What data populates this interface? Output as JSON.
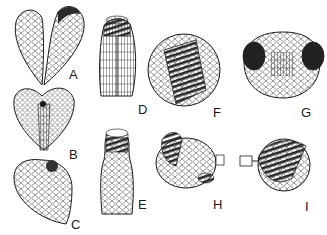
{
  "figure": {
    "panels": [
      {
        "id": "A",
        "label": "A",
        "x": 69,
        "y": 68,
        "subject": "bilobed-leaf"
      },
      {
        "id": "B",
        "label": "B",
        "x": 69,
        "y": 148,
        "subject": "heart-shaped-leaf"
      },
      {
        "id": "C",
        "label": "C",
        "x": 71,
        "y": 218,
        "subject": "ovoid-capsule"
      },
      {
        "id": "D",
        "label": "D",
        "x": 138,
        "y": 103,
        "subject": "elongate-capsule-top"
      },
      {
        "id": "E",
        "label": "E",
        "x": 138,
        "y": 198,
        "subject": "elongate-capsule-collar"
      },
      {
        "id": "F",
        "label": "F",
        "x": 213,
        "y": 106,
        "subject": "spherical-body-ribbed"
      },
      {
        "id": "G",
        "label": "G",
        "x": 301,
        "y": 106,
        "subject": "dome-with-lateral-lobes"
      },
      {
        "id": "H",
        "label": "H",
        "x": 213,
        "y": 198,
        "subject": "body-with-appendage"
      },
      {
        "id": "I",
        "label": "I",
        "x": 305,
        "y": 200,
        "subject": "ribbed-globe-with-stalk"
      }
    ],
    "colors": {
      "ink": "#1a1a1a",
      "background": "#ffffff",
      "shade": "#555555"
    }
  }
}
